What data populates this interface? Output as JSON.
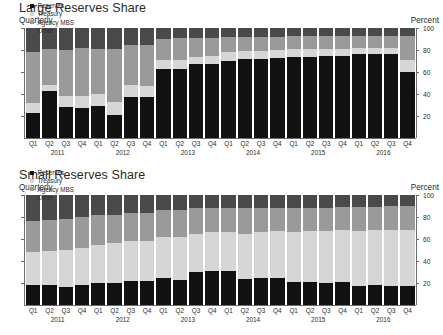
{
  "panels": [
    {
      "title": "Large Reserves Share",
      "subtitle": "Quarterly",
      "unit": "Percent"
    },
    {
      "title": "Small Reserves Share",
      "subtitle": "Quarterly",
      "unit": "Percent"
    }
  ],
  "legend": {
    "items": [
      {
        "label": "Reserves",
        "color": "#111111"
      },
      {
        "label": "Treasury",
        "color": "#d6d6d6"
      },
      {
        "label": "Agency MBS",
        "color": "#9a9a9a"
      },
      {
        "label": "Other",
        "color": "#4a4a4a"
      }
    ]
  },
  "axis": {
    "tick_labels": [
      "20",
      "40",
      "60",
      "80",
      "100"
    ],
    "tick_values": [
      20,
      40,
      60,
      80,
      100
    ]
  },
  "chart_data": [
    {
      "type": "bar",
      "title": "Large Reserves Share",
      "subtitle": "Quarterly",
      "xlabel": "",
      "ylabel": "Percent",
      "ylim": [
        0,
        100
      ],
      "stacked": true,
      "grid": false,
      "legend_position": "top-left",
      "categories": [
        "Q1 2011",
        "Q2 2011",
        "Q3 2011",
        "Q4 2011",
        "Q1 2012",
        "Q2 2012",
        "Q3 2012",
        "Q4 2012",
        "Q1 2013",
        "Q2 2013",
        "Q3 2013",
        "Q4 2013",
        "Q1 2014",
        "Q2 2014",
        "Q3 2014",
        "Q4 2014",
        "Q1 2015",
        "Q2 2015",
        "Q3 2015",
        "Q4 2015",
        "Q1 2016",
        "Q2 2016",
        "Q3 2016",
        "Q4 2016"
      ],
      "quarter_labels": [
        "Q1",
        "Q2",
        "Q3",
        "Q4",
        "Q1",
        "Q2",
        "Q3",
        "Q4",
        "Q1",
        "Q2",
        "Q3",
        "Q4",
        "Q1",
        "Q2",
        "Q3",
        "Q4",
        "Q1",
        "Q2",
        "Q3",
        "Q4",
        "Q1",
        "Q2",
        "Q3",
        "Q4"
      ],
      "year_labels": [
        "2011",
        "2012",
        "2013",
        "2014",
        "2015",
        "2016"
      ],
      "series": [
        {
          "name": "Reserves",
          "color": "#111111",
          "values": [
            23,
            43,
            28,
            27,
            29,
            21,
            37,
            37,
            63,
            63,
            67,
            67,
            70,
            72,
            72,
            73,
            74,
            74,
            75,
            75,
            76,
            76,
            76,
            60
          ]
        },
        {
          "name": "Treasury",
          "color": "#d6d6d6",
          "values": [
            9,
            5,
            10,
            11,
            11,
            12,
            11,
            10,
            8,
            8,
            7,
            8,
            8,
            7,
            7,
            7,
            7,
            7,
            6,
            6,
            6,
            6,
            6,
            11
          ]
        },
        {
          "name": "Agency MBS",
          "color": "#9a9a9a",
          "values": [
            46,
            33,
            42,
            44,
            41,
            48,
            37,
            38,
            19,
            20,
            17,
            16,
            14,
            13,
            13,
            12,
            12,
            12,
            12,
            12,
            11,
            11,
            11,
            22
          ]
        },
        {
          "name": "Other",
          "color": "#4a4a4a",
          "values": [
            22,
            19,
            20,
            18,
            19,
            19,
            15,
            15,
            10,
            9,
            9,
            9,
            8,
            8,
            8,
            8,
            7,
            7,
            7,
            7,
            7,
            7,
            7,
            7
          ]
        }
      ]
    },
    {
      "type": "bar",
      "title": "Small Reserves Share",
      "subtitle": "Quarterly",
      "xlabel": "",
      "ylabel": "Percent",
      "ylim": [
        0,
        100
      ],
      "stacked": true,
      "grid": false,
      "legend_position": "top-left",
      "categories": [
        "Q1 2011",
        "Q2 2011",
        "Q3 2011",
        "Q4 2011",
        "Q1 2012",
        "Q2 2012",
        "Q3 2012",
        "Q4 2012",
        "Q1 2013",
        "Q2 2013",
        "Q3 2013",
        "Q4 2013",
        "Q1 2014",
        "Q2 2014",
        "Q3 2014",
        "Q4 2014",
        "Q1 2015",
        "Q2 2015",
        "Q3 2015",
        "Q4 2015",
        "Q1 2016",
        "Q2 2016",
        "Q3 2016",
        "Q4 2016"
      ],
      "quarter_labels": [
        "Q1",
        "Q2",
        "Q3",
        "Q4",
        "Q1",
        "Q2",
        "Q3",
        "Q4",
        "Q1",
        "Q2",
        "Q3",
        "Q4",
        "Q1",
        "Q2",
        "Q3",
        "Q4",
        "Q1",
        "Q2",
        "Q3",
        "Q4",
        "Q1",
        "Q2",
        "Q3",
        "Q4"
      ],
      "year_labels": [
        "2011",
        "2012",
        "2013",
        "2014",
        "2015",
        "2016"
      ],
      "series": [
        {
          "name": "Reserves",
          "color": "#111111",
          "values": [
            18,
            18,
            16,
            18,
            20,
            20,
            22,
            22,
            25,
            23,
            30,
            31,
            31,
            24,
            25,
            25,
            21,
            21,
            20,
            21,
            17,
            18,
            17,
            17
          ]
        },
        {
          "name": "Treasury",
          "color": "#d6d6d6",
          "values": [
            30,
            31,
            34,
            34,
            35,
            36,
            36,
            36,
            37,
            39,
            35,
            35,
            35,
            41,
            41,
            42,
            45,
            46,
            47,
            47,
            50,
            50,
            51,
            51
          ]
        },
        {
          "name": "Agency MBS",
          "color": "#9a9a9a",
          "values": [
            28,
            28,
            28,
            28,
            27,
            26,
            26,
            26,
            24,
            24,
            23,
            22,
            22,
            23,
            22,
            21,
            22,
            21,
            21,
            21,
            22,
            21,
            22,
            22
          ]
        },
        {
          "name": "Other",
          "color": "#4a4a4a",
          "values": [
            24,
            23,
            22,
            20,
            18,
            18,
            16,
            16,
            14,
            14,
            12,
            12,
            12,
            12,
            12,
            12,
            12,
            12,
            12,
            11,
            11,
            11,
            10,
            10
          ]
        }
      ]
    }
  ]
}
